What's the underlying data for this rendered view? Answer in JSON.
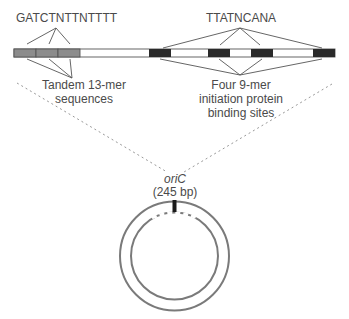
{
  "diagram": {
    "consensus_13mer": "GATCTNTTNTTTT",
    "consensus_9mer": "TTATNCANA",
    "label_13mer_line1": "Tandem 13-mer",
    "label_13mer_line2": "sequences",
    "label_9mer_line1": "Four 9-mer",
    "label_9mer_line2": "initiation protein",
    "label_9mer_line3": "binding sites",
    "origin_name": "oriC",
    "origin_size": "(245 bp)"
  },
  "colors": {
    "tandem_13mer_fill": "#8c8c8c",
    "binding_9mer_fill": "#2a2a2a",
    "bar_fill": "#ffffff",
    "line": "#555555",
    "circle": "#7a7a7a",
    "text": "#4a4a4a"
  },
  "segments": {
    "tandem_13mers": 3,
    "binding_9mers": 4
  }
}
